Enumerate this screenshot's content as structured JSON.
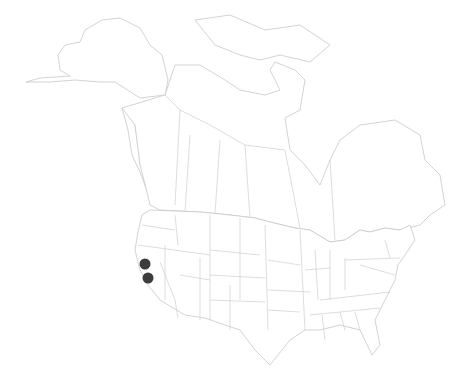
{
  "map": {
    "region": "North America (Canada, United States, Alaska)",
    "style": "outline map of states and provinces",
    "background_color": "#ffffff",
    "border_color": "#c8c8c8",
    "marker_color": "#3c3c3c",
    "markers": [
      {
        "id": "marker-1",
        "region": "California (northern)",
        "cx": 145,
        "cy": 264,
        "r": 5.5
      },
      {
        "id": "marker-2",
        "region": "California (central)",
        "cx": 148,
        "cy": 278,
        "r": 5.5
      }
    ]
  }
}
